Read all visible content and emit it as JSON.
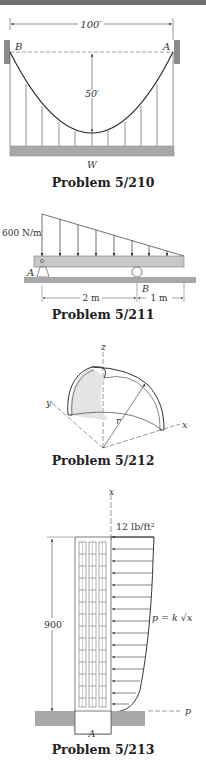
{
  "colors": {
    "ink": "#333333",
    "ground": "#a8a8a8",
    "topbar": "#6e6e6e"
  },
  "problems": [
    {
      "id": "5/210",
      "caption": "Problem 5/210",
      "labels": {
        "span": "100′",
        "sag": "50′",
        "left_support": "B",
        "right_support": "A",
        "load": "W"
      }
    },
    {
      "id": "5/211",
      "caption": "Problem 5/211",
      "labels": {
        "load_intensity": "600 N/m",
        "pin_support": "A",
        "roller_support": "B",
        "dim_left": "2 m",
        "dim_right": "1 m"
      }
    },
    {
      "id": "5/212",
      "caption": "Problem 5/212",
      "labels": {
        "z_axis": "z",
        "y_axis": "y",
        "x_axis": "x",
        "radius": "r"
      }
    },
    {
      "id": "5/213",
      "caption": "Problem 5/213",
      "labels": {
        "x_axis": "x",
        "top_pressure": "12 lb/ft²",
        "height": "900′",
        "pressure_law": "p = k √x",
        "base": "A",
        "p_axis": "p"
      }
    }
  ]
}
